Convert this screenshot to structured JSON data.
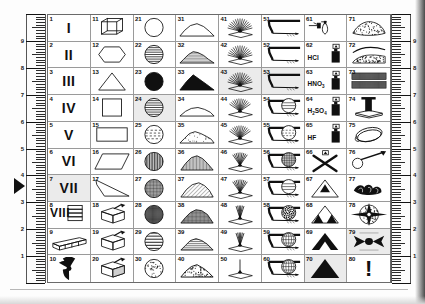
{
  "document": {
    "kind": "symbol-legend-sheet",
    "columns": 8,
    "rows": 10,
    "total_cells": 80
  },
  "ruler_left": {
    "name": "left-ruler",
    "labels": [
      "9",
      "8",
      "7",
      "6",
      "5",
      "4",
      "3",
      "2",
      "1"
    ],
    "minor_divisions_per_unit": 10
  },
  "ruler_right": {
    "name": "right-ruler",
    "labels": [
      "9",
      "8",
      "7",
      "6",
      "5",
      "4",
      "3",
      "2",
      "1"
    ],
    "minor_divisions_per_unit": 10
  },
  "pointer": {
    "name": "row-pointer-triangle",
    "points_at_row": 7
  },
  "cells": [
    {
      "n": "1",
      "art": "roman-numeral",
      "text": "I",
      "shade": false
    },
    {
      "n": "11",
      "art": "wireframe-cube",
      "text": "",
      "shade": false
    },
    {
      "n": "21",
      "art": "circle-blank",
      "text": "",
      "shade": false
    },
    {
      "n": "31",
      "art": "hill-outline-low",
      "text": "",
      "shade": false
    },
    {
      "n": "41",
      "art": "fan-spray-wide",
      "text": "",
      "shade": false
    },
    {
      "n": "51",
      "art": "nozzle-jet-flat",
      "text": "",
      "shade": false
    },
    {
      "n": "61",
      "art": "dropper-bottle",
      "text": "",
      "shade": false
    },
    {
      "n": "71",
      "art": "stippled-mound",
      "text": "",
      "shade": false
    },
    {
      "n": "2",
      "art": "roman-numeral",
      "text": "II",
      "shade": false
    },
    {
      "n": "12",
      "art": "hexagon-outline",
      "text": "",
      "shade": false
    },
    {
      "n": "22",
      "art": "circle-horizontal-lines",
      "text": "",
      "shade": false
    },
    {
      "n": "32",
      "art": "hill-hatched-low",
      "text": "",
      "shade": false
    },
    {
      "n": "42",
      "art": "fan-spray-wide",
      "text": "",
      "shade": false
    },
    {
      "n": "52",
      "art": "nozzle-jet-flat",
      "text": "",
      "shade": false
    },
    {
      "n": "62",
      "art": "reagent-bottle",
      "text": "HCl",
      "shade": false
    },
    {
      "n": "72",
      "art": "layered-sediment",
      "text": "",
      "shade": false
    },
    {
      "n": "3",
      "art": "roman-numeral",
      "text": "III",
      "shade": false
    },
    {
      "n": "13",
      "art": "triangle-outline",
      "text": "",
      "shade": false
    },
    {
      "n": "23",
      "art": "circle-solid-black",
      "text": "",
      "shade": false
    },
    {
      "n": "33",
      "art": "hill-solid-black",
      "text": "",
      "shade": false
    },
    {
      "n": "43",
      "art": "fan-spray-wide",
      "text": "",
      "shade": true
    },
    {
      "n": "53",
      "art": "nozzle-jet-flat",
      "text": "",
      "shade": true
    },
    {
      "n": "63",
      "art": "reagent-bottle",
      "text": "HNO3",
      "shade": false
    },
    {
      "n": "73",
      "art": "woven-texture-band",
      "text": "",
      "shade": false
    },
    {
      "n": "4",
      "art": "roman-numeral",
      "text": "IV",
      "shade": false
    },
    {
      "n": "14",
      "art": "square-outline",
      "text": "",
      "shade": false
    },
    {
      "n": "24",
      "art": "circle-horizontal-lines",
      "text": "",
      "shade": true
    },
    {
      "n": "34",
      "art": "hill-outline-broad",
      "text": "",
      "shade": false
    },
    {
      "n": "44",
      "art": "fan-spray-medium",
      "text": "",
      "shade": false
    },
    {
      "n": "54",
      "art": "nozzle-with-sphere-lines",
      "text": "",
      "shade": false
    },
    {
      "n": "64",
      "art": "reagent-bottle",
      "text": "H2SO4",
      "shade": false
    },
    {
      "n": "74",
      "art": "column-pedestal",
      "text": "",
      "shade": false
    },
    {
      "n": "5",
      "art": "roman-numeral",
      "text": "V",
      "shade": false
    },
    {
      "n": "15",
      "art": "rectangle-outline",
      "text": "",
      "shade": false
    },
    {
      "n": "25",
      "art": "circle-dashed-lines",
      "text": "",
      "shade": false
    },
    {
      "n": "35",
      "art": "hill-stippled",
      "text": "",
      "shade": false
    },
    {
      "n": "45",
      "art": "fan-spray-medium",
      "text": "",
      "shade": false
    },
    {
      "n": "55",
      "art": "nozzle-with-sphere-dashes",
      "text": "",
      "shade": false
    },
    {
      "n": "65",
      "art": "reagent-bottle",
      "text": "HF",
      "shade": false
    },
    {
      "n": "75",
      "art": "coiled-rope-loop",
      "text": "",
      "shade": false
    },
    {
      "n": "6",
      "art": "roman-numeral",
      "text": "VI",
      "shade": false
    },
    {
      "n": "16",
      "art": "parallelogram-outline",
      "text": "",
      "shade": false
    },
    {
      "n": "26",
      "art": "circle-vertical-lines",
      "text": "",
      "shade": false
    },
    {
      "n": "36",
      "art": "hill-vertical-hatch",
      "text": "",
      "shade": false
    },
    {
      "n": "46",
      "art": "fan-spray-narrow",
      "text": "",
      "shade": false
    },
    {
      "n": "56",
      "art": "nozzle-with-sphere-grid",
      "text": "",
      "shade": false
    },
    {
      "n": "66",
      "art": "crossed-bones-x",
      "text": "",
      "shade": false
    },
    {
      "n": "76",
      "art": "hook-probe-tool",
      "text": "",
      "shade": false
    },
    {
      "n": "7",
      "art": "roman-numeral",
      "text": "VII",
      "shade": true
    },
    {
      "n": "17",
      "art": "wedge-quadrilateral",
      "text": "",
      "shade": false
    },
    {
      "n": "27",
      "art": "circle-crosshatch-fine",
      "text": "",
      "shade": false
    },
    {
      "n": "37",
      "art": "hill-diagonal-hatch",
      "text": "",
      "shade": false
    },
    {
      "n": "47",
      "art": "fan-spray-narrow",
      "text": "",
      "shade": false
    },
    {
      "n": "57",
      "art": "nozzle-with-sphere-lines",
      "text": "",
      "shade": false
    },
    {
      "n": "67",
      "art": "triangle-one-peak",
      "text": "",
      "shade": false
    },
    {
      "n": "77",
      "art": "scattered-debris",
      "text": "",
      "shade": false
    },
    {
      "n": "8",
      "art": "roman-numeral-with-bars",
      "text": "VIII",
      "shade": false
    },
    {
      "n": "18",
      "art": "package-box-tool",
      "text": "",
      "shade": false
    },
    {
      "n": "28",
      "art": "circle-grid-mesh",
      "text": "",
      "shade": false
    },
    {
      "n": "38",
      "art": "hill-mesh-fill",
      "text": "",
      "shade": false
    },
    {
      "n": "48",
      "art": "fan-spray-thin",
      "text": "",
      "shade": false
    },
    {
      "n": "58",
      "art": "nozzle-with-sphere-speckle",
      "text": "",
      "shade": false
    },
    {
      "n": "68",
      "art": "triangle-two-subpeaks",
      "text": "",
      "shade": false
    },
    {
      "n": "78",
      "art": "radial-burst-disc",
      "text": "",
      "shade": false
    },
    {
      "n": "9",
      "art": "prism-bar-3d",
      "text": "",
      "shade": false
    },
    {
      "n": "19",
      "art": "package-box-tool",
      "text": "",
      "shade": false
    },
    {
      "n": "29",
      "art": "circle-wide-lines",
      "text": "",
      "shade": false
    },
    {
      "n": "39",
      "art": "hill-layered-lines",
      "text": "",
      "shade": false
    },
    {
      "n": "49",
      "art": "fan-spray-thin",
      "text": "",
      "shade": false
    },
    {
      "n": "59",
      "art": "nozzle-with-sphere-globe",
      "text": "",
      "shade": false
    },
    {
      "n": "69",
      "art": "sierpinski-triangle",
      "text": "",
      "shade": false
    },
    {
      "n": "79",
      "art": "winged-burst",
      "text": "",
      "shade": true
    },
    {
      "n": "10",
      "art": "radiation-trefoil",
      "text": "",
      "shade": false
    },
    {
      "n": "20",
      "art": "package-box-tool-dark",
      "text": "",
      "shade": false
    },
    {
      "n": "30",
      "art": "circle-cloud-speckle",
      "text": "",
      "shade": false
    },
    {
      "n": "40",
      "art": "hill-textured-dark",
      "text": "",
      "shade": false
    },
    {
      "n": "50",
      "art": "fan-spray-single",
      "text": "",
      "shade": false
    },
    {
      "n": "60",
      "art": "nozzle-with-sphere-globe",
      "text": "",
      "shade": false
    },
    {
      "n": "70",
      "art": "triangle-solid-black",
      "text": "",
      "shade": true
    },
    {
      "n": "80",
      "art": "exclamation-mark",
      "text": "!",
      "shade": false
    }
  ],
  "colors": {
    "ink": "#101010",
    "rule": "#9a9a9a",
    "frame": "#6a6a6a",
    "shade": "#ebebeb",
    "paper": "#ffffff"
  }
}
